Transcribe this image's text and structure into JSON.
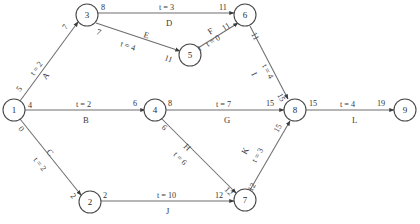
{
  "diagram": {
    "type": "activity-on-arrow network",
    "nodes": [
      {
        "id": "1",
        "label": "1",
        "x": 14,
        "y": 110
      },
      {
        "id": "2",
        "label": "2",
        "x": 90,
        "y": 202
      },
      {
        "id": "3",
        "label": "3",
        "x": 87,
        "y": 15
      },
      {
        "id": "4",
        "label": "4",
        "x": 155,
        "y": 110
      },
      {
        "id": "5",
        "label": "5",
        "x": 190,
        "y": 55
      },
      {
        "id": "6",
        "label": "6",
        "x": 245,
        "y": 15
      },
      {
        "id": "7",
        "label": "7",
        "x": 245,
        "y": 200
      },
      {
        "id": "8",
        "label": "8",
        "x": 295,
        "y": 110
      },
      {
        "id": "9",
        "label": "9",
        "x": 405,
        "y": 110
      }
    ],
    "edges": [
      {
        "id": "A",
        "from": "1",
        "to": "3",
        "activity": "A",
        "duration_text": "t = 2",
        "duration": 2,
        "tail_num": "5",
        "head_num": "7"
      },
      {
        "id": "B",
        "from": "1",
        "to": "4",
        "activity": "B",
        "duration_text": "t = 2",
        "duration": 2,
        "tail_num": "4",
        "head_num": "6"
      },
      {
        "id": "C",
        "from": "1",
        "to": "2",
        "activity": "C",
        "duration_text": "t = 2",
        "duration": 2,
        "tail_num": "0",
        "head_num": "2"
      },
      {
        "id": "D",
        "from": "3",
        "to": "6",
        "activity": "D",
        "duration_text": "t = 3",
        "duration": 3,
        "tail_num": "8",
        "head_num": "11"
      },
      {
        "id": "E",
        "from": "3",
        "to": "5",
        "activity": "E",
        "duration_text": "t = 4",
        "duration": 4,
        "tail_num": "7",
        "head_num": "11"
      },
      {
        "id": "F",
        "from": "5",
        "to": "6",
        "activity": "F",
        "duration_text": "t = 0",
        "duration": 0,
        "tail_num": "11",
        "head_num": "11"
      },
      {
        "id": "G",
        "from": "4",
        "to": "8",
        "activity": "G",
        "duration_text": "t = 7",
        "duration": 7,
        "tail_num": "8",
        "head_num": "15"
      },
      {
        "id": "H",
        "from": "4",
        "to": "7",
        "activity": "H",
        "duration_text": "t = 6",
        "duration": 6,
        "tail_num": "6",
        "head_num": "12"
      },
      {
        "id": "I",
        "from": "6",
        "to": "8",
        "activity": "I",
        "duration_text": "t = 4",
        "duration": 4,
        "tail_num": "11",
        "head_num": "15"
      },
      {
        "id": "J",
        "from": "2",
        "to": "7",
        "activity": "J",
        "duration_text": "t = 10",
        "duration": 10,
        "tail_num": "2",
        "head_num": "12"
      },
      {
        "id": "K",
        "from": "7",
        "to": "8",
        "activity": "K",
        "duration_text": "t = 3",
        "duration": 3,
        "tail_num": "12",
        "head_num": "15"
      },
      {
        "id": "L",
        "from": "8",
        "to": "9",
        "activity": "L",
        "duration_text": "t = 4",
        "duration": 4,
        "tail_num": "15",
        "head_num": "19"
      }
    ],
    "labels": {
      "n1": "1",
      "n2": "2",
      "n3": "3",
      "n4": "4",
      "n5": "5",
      "n6": "6",
      "n7": "7",
      "n8": "8",
      "n9": "9",
      "actA": "A",
      "actB": "B",
      "actC": "C",
      "actD": "D",
      "actE": "E",
      "actF": "F",
      "actG": "G",
      "actH": "H",
      "actI": "I",
      "actJ": "J",
      "actK": "K",
      "actL": "L",
      "tA": "t = 2",
      "tB": "t = 2",
      "tC": "t = 2",
      "tD": "t = 3",
      "tE": "t = 4",
      "tF": "t = 0",
      "tG": "t = 7",
      "tH": "t = 6",
      "tI": "t = 4",
      "tJ": "t = 10",
      "tK": "t = 3",
      "tL": "t = 4",
      "numA_tail": "5",
      "numA_head": "7",
      "numB_tail": "4",
      "numB_head": "6",
      "numC_tail": "0",
      "numC_head": "2",
      "numD_tail": "8",
      "numD_head": "11",
      "numE_tail": "7",
      "numE_head": "11",
      "numF_tail": "11",
      "numF_head": "11",
      "numG_tail": "8",
      "numG_head": "15",
      "numH_tail": "6",
      "numH_head": "12",
      "numI_tail": "11",
      "numI_head": "15",
      "numJ_tail": "2",
      "numJ_head": "12",
      "numK_tail": "12",
      "numK_head": "15",
      "numL_tail": "15",
      "numL_head": "19"
    },
    "colors": {
      "stroke": "#6e6e6e",
      "node_stroke": "#4a4a4a",
      "text": "#2b2b2b",
      "background": "#ffffff"
    }
  }
}
